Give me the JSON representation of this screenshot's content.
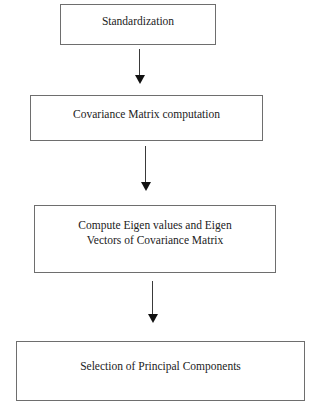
{
  "diagram": {
    "type": "flowchart",
    "direction": "top-to-bottom",
    "nodes": [
      {
        "id": "standardization",
        "label": "Standardization"
      },
      {
        "id": "covariance",
        "label": "Covariance Matrix computation"
      },
      {
        "id": "eigen",
        "label": "Compute Eigen values and Eigen Vectors of Covariance Matrix",
        "lines": [
          "Compute Eigen values and Eigen",
          "Vectors of Covariance Matrix"
        ]
      },
      {
        "id": "selection",
        "label": "Selection of Principal Components"
      }
    ],
    "edges": [
      {
        "from": "standardization",
        "to": "covariance"
      },
      {
        "from": "covariance",
        "to": "eigen"
      },
      {
        "from": "eigen",
        "to": "selection"
      }
    ],
    "colors": {
      "box_border": "#6e6e6e",
      "arrow": "#111111",
      "text": "#222222",
      "background": "#ffffff"
    }
  }
}
